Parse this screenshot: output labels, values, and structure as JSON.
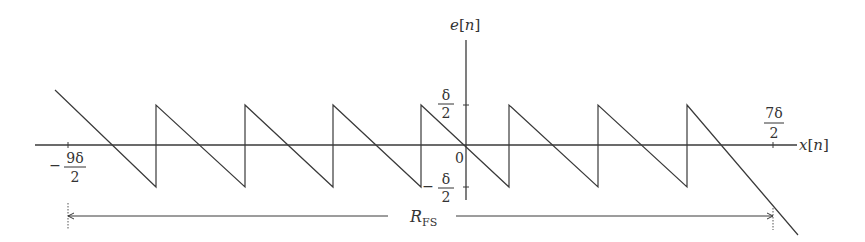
{
  "diagram": {
    "y_axis_label": "e[n]",
    "x_axis_label": "x[n]",
    "origin_label": "0",
    "y_ticks": [
      {
        "sign": "",
        "num": "δ",
        "den": "2"
      },
      {
        "sign": "−",
        "num": "δ",
        "den": "2"
      }
    ],
    "x_ticks": [
      {
        "sign": "−",
        "num": "9δ",
        "den": "2"
      },
      {
        "sign": "",
        "num": "7δ",
        "den": "2"
      }
    ],
    "range_label_main": "R",
    "range_label_sub": "FS",
    "colors": {
      "line": "#3a3a3a",
      "text": "#333333"
    }
  }
}
